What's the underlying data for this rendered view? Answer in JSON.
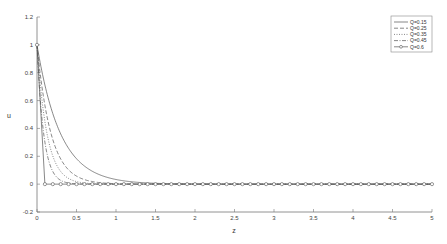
{
  "chart_data": {
    "type": "line",
    "title": "",
    "xlabel": "z",
    "ylabel": "u",
    "xlim": [
      0,
      5
    ],
    "ylim": [
      -0.2,
      1.2
    ],
    "xticks": [
      0,
      0.5,
      1,
      1.5,
      2,
      2.5,
      3,
      3.5,
      4,
      4.5,
      5
    ],
    "xtick_labels": [
      "0",
      "0.5",
      "1",
      "1.5",
      "2",
      "2.5",
      "3",
      "3.5",
      "4",
      "4.5",
      "5"
    ],
    "yticks": [
      -0.2,
      0,
      0.2,
      0.4,
      0.6,
      0.8,
      1,
      1.2
    ],
    "ytick_labels": [
      "-0.2",
      "0",
      "0.2",
      "0.4",
      "0.6",
      "0.8",
      "1",
      "1.2"
    ],
    "grid": false,
    "legend_position": "upper right",
    "series": [
      {
        "name": "Q=0.15",
        "style": "solid",
        "decay_rate": 3.4,
        "x": [
          0,
          0.1,
          0.2,
          0.3,
          0.4,
          0.5,
          0.6,
          0.7,
          0.8,
          0.9,
          1.0,
          1.2,
          1.5,
          2,
          3,
          4,
          5
        ],
        "values": [
          1,
          0.71,
          0.51,
          0.36,
          0.26,
          0.18,
          0.13,
          0.09,
          0.07,
          0.05,
          0.03,
          0.02,
          0.01,
          0,
          0,
          0,
          0
        ]
      },
      {
        "name": "Q=0.25",
        "style": "dashed",
        "decay_rate": 5.7,
        "x": [
          0,
          0.1,
          0.2,
          0.3,
          0.4,
          0.5,
          0.6,
          0.8,
          1.0,
          1.5,
          2,
          3,
          4,
          5
        ],
        "values": [
          1,
          0.57,
          0.32,
          0.18,
          0.1,
          0.06,
          0.03,
          0.01,
          0,
          0,
          0,
          0,
          0,
          0
        ]
      },
      {
        "name": "Q=0.35",
        "style": "dotted",
        "decay_rate": 8,
        "x": [
          0,
          0.1,
          0.2,
          0.3,
          0.4,
          0.5,
          0.6,
          0.8,
          1.0,
          2,
          3,
          4,
          5
        ],
        "values": [
          1,
          0.45,
          0.2,
          0.09,
          0.04,
          0.02,
          0.01,
          0,
          0,
          0,
          0,
          0,
          0
        ]
      },
      {
        "name": "Q=0.45",
        "style": "dashdot",
        "decay_rate": 12,
        "x": [
          0,
          0.1,
          0.2,
          0.3,
          0.4,
          0.5,
          1.0,
          2,
          3,
          4,
          5
        ],
        "values": [
          1,
          0.3,
          0.09,
          0.03,
          0.01,
          0,
          0,
          0,
          0,
          0,
          0
        ]
      },
      {
        "name": "Q=0.6",
        "style": "solid-circle-markers",
        "decay_rate": null,
        "x": [
          0,
          0.1,
          0.2,
          0.3,
          0.5,
          1.0,
          2,
          3,
          4,
          5
        ],
        "values": [
          1,
          0,
          0,
          0,
          0,
          0,
          0,
          0,
          0,
          0
        ],
        "marker_spacing": 0.1
      }
    ]
  },
  "colors": {
    "axis": "#777777",
    "line": "#555555",
    "legend_border": "#888888",
    "background": "#ffffff"
  }
}
